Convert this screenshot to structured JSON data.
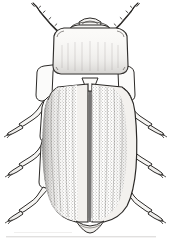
{
  "figure": {
    "domain": "Natural-Image",
    "subject_common_name": "Beetle",
    "view": "dorsal",
    "medium": "pen-and-ink stipple line drawing",
    "orientation": "head at top, abdomen at bottom",
    "canvas": {
      "width": 181,
      "height": 241
    },
    "background_color": "#ffffff",
    "ink_color": "#1a1a1a",
    "shade_color": "#6d6d6d",
    "eye_color": "#0d0d0d",
    "elytra_fill": "#e9e7e3",
    "body_fill": "#f5f4f2"
  },
  "anatomy": {
    "parts": [
      {
        "name": "antenna-left",
        "label": "Left antenna",
        "segments": 11,
        "description": "segmented, filiform, directed up and outward to upper-left"
      },
      {
        "name": "antenna-right",
        "label": "Right antenna",
        "segments": 11,
        "description": "segmented, filiform, directed up and outward to upper-right"
      },
      {
        "name": "head",
        "label": "Head",
        "description": "narrow, largely concealed beneath pronotum, with labrum and mouthparts at apex"
      },
      {
        "name": "eye-left",
        "label": "Left compound eye",
        "description": "large, dark, ovate, at anterolateral angle of head"
      },
      {
        "name": "eye-right",
        "label": "Right compound eye",
        "description": "large, dark, ovate, at anterolateral angle of head"
      },
      {
        "name": "pronotum",
        "label": "Pronotum",
        "description": "broad, subquadrate, wider than head, with rounded front angles"
      },
      {
        "name": "scutellum",
        "label": "Scutellum",
        "description": "small triangular plate between elytral bases"
      },
      {
        "name": "elytron-left",
        "label": "Left elytron",
        "description": "elongate, finely punctate/stippled, with faint longitudinal striae"
      },
      {
        "name": "elytron-right",
        "label": "Right elytron",
        "description": "elongate, finely punctate/stippled, with faint longitudinal striae"
      },
      {
        "name": "elytral-suture",
        "label": "Elytral suture",
        "description": "median line dividing the two elytra, running full length"
      },
      {
        "name": "abdomen-apex",
        "label": "Abdominal apex",
        "description": "rounded tip visible beyond elytra"
      },
      {
        "name": "foreleg-left",
        "label": "Left foreleg",
        "description": "femur, tibia and tarsus directed outward to the left"
      },
      {
        "name": "foreleg-right",
        "label": "Right foreleg",
        "description": "femur, tibia and tarsus directed outward to the right"
      },
      {
        "name": "midleg-left",
        "label": "Left midleg",
        "description": "femur, tibia and tarsus, bent at knee, directed down-left"
      },
      {
        "name": "midleg-right",
        "label": "Right midleg",
        "description": "femur, tibia and tarsus, bent at knee, directed down-right"
      },
      {
        "name": "hindleg-left",
        "label": "Left hindleg",
        "description": "long femur and tibia, tarsus directed down-left"
      },
      {
        "name": "hindleg-right",
        "label": "Right hindleg",
        "description": "long femur and tibia, tarsus directed down-right"
      }
    ]
  },
  "caption": {
    "text": ""
  }
}
